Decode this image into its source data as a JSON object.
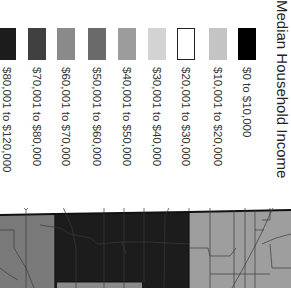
{
  "legend": {
    "title": "Median Household Income",
    "items": [
      {
        "label": "$0 to $10,000",
        "color": "#000000",
        "outlined": false,
        "x": 238
      },
      {
        "label": "$10,001 to $20,000",
        "color": "#c4c4c4",
        "outlined": false,
        "x": 209
      },
      {
        "label": "$20,001 to $30,000",
        "color": "#ffffff",
        "outlined": true,
        "x": 177
      },
      {
        "label": "$30,001 to $40,000",
        "color": "#d3d3d3",
        "outlined": false,
        "x": 148
      },
      {
        "label": "$40,001 to $50,000",
        "color": "#9c9c9c",
        "outlined": false,
        "x": 118
      },
      {
        "label": "$50,001 to $60,000",
        "color": "#6a6a6a",
        "outlined": false,
        "x": 88
      },
      {
        "label": "$60,001 to $70,000",
        "color": "#8a8a8a",
        "outlined": false,
        "x": 57
      },
      {
        "label": "$70,001 to $80,000",
        "color": "#404040",
        "outlined": false,
        "x": 28
      },
      {
        "label": "$80,001 to $120,000",
        "color": "#1c1c1c",
        "outlined": false,
        "x": -2
      }
    ]
  },
  "map": {
    "regions": [
      {
        "name": "region-left",
        "color": "#7a7a7a"
      },
      {
        "name": "region-center",
        "color": "#1c1c1c"
      },
      {
        "name": "region-right",
        "color": "#9e9e9e"
      }
    ],
    "border_color": "#111111",
    "road_color": "#3a3a3a"
  }
}
